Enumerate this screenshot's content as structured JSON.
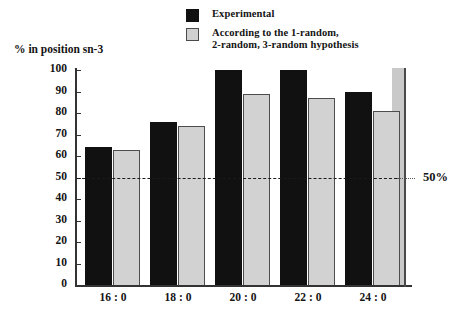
{
  "legend": {
    "items": [
      {
        "label": "Experimental",
        "swatch": "dark",
        "color": "#111111"
      },
      {
        "label": "According to the 1-random,\n2-random, 3-random hypothesis",
        "swatch": "light",
        "color": "#d0d0d0"
      }
    ],
    "item0_label": "Experimental",
    "item1_line1": "According to the 1-random,",
    "item1_line2": "2-random, 3-random hypothesis"
  },
  "axis": {
    "y_title": "% in position sn-3",
    "y_ticks": [
      "100",
      "90",
      "80",
      "70",
      "60",
      "50",
      "40",
      "30",
      "20",
      "10",
      "0"
    ]
  },
  "annotation": {
    "ref_label": "50%"
  },
  "chart_data": {
    "type": "bar",
    "title": "",
    "subtitle": "",
    "xlabel": "",
    "ylabel": "% in position sn-3",
    "ylim": [
      0,
      100
    ],
    "ytick_step": 10,
    "grid": false,
    "legend_position": "top-right",
    "categories": [
      "16 : 0",
      "18 : 0",
      "20 : 0",
      "22 : 0",
      "24 : 0"
    ],
    "series": [
      {
        "name": "Experimental",
        "color": "#111111",
        "values": [
          64,
          76,
          100,
          100,
          90
        ]
      },
      {
        "name": "According to the 1-random, 2-random, 3-random hypothesis",
        "color": "#d2d2d2",
        "values": [
          63,
          74,
          89,
          87,
          81
        ]
      }
    ],
    "reference_line": {
      "value": 50,
      "label": "50%",
      "style": "dashed"
    }
  }
}
